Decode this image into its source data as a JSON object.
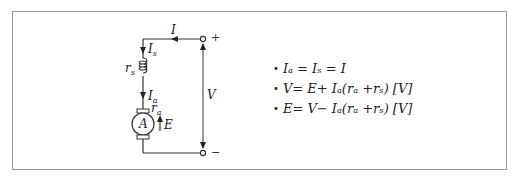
{
  "heading": "",
  "circuit": {
    "title": "Series DC motor equivalent circuit",
    "labels": {
      "current_total": "I",
      "current_series": "I",
      "current_series_sub": "s",
      "resistance_series": "r",
      "resistance_series_sub": "s",
      "current_armature": "I",
      "current_armature_sub": "a",
      "resistance_armature": "r",
      "resistance_armature_sub": "a",
      "armature": "A",
      "emf": "E",
      "voltage": "V",
      "terminal_positive": "+",
      "terminal_negative": "−"
    }
  },
  "equations": [
    "Iₐ = Iₛ = I",
    "V = E + Iₐ(rₐ + rₛ) [V]",
    "E = V − Iₐ(rₐ + rₛ) [V]"
  ],
  "equation_parts": {
    "eq1": {
      "bullet": "•",
      "text": "Iₐ = Iₛ = I"
    },
    "eq2": {
      "bullet": "•",
      "text": "V= E+ Iₐ(rₐ +rₛ) [V]"
    },
    "eq3": {
      "bullet": "•",
      "text": "E= V− Iₐ(rₐ +rₛ) [V]"
    }
  },
  "colors": {
    "line": "#333333",
    "frame": "#9a9a9a",
    "background": "#ffffff"
  }
}
